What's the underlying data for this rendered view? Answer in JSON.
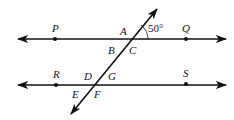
{
  "diagram": {
    "type": "parallel lines cut by a transversal",
    "colors": {
      "line": "#111111",
      "background": "#ffffff"
    },
    "lines": {
      "upper": {
        "name": "line PQ",
        "y": 39
      },
      "lower": {
        "name": "line RS",
        "y": 85
      },
      "transversal": {
        "from": [
          70,
          115
        ],
        "to": [
          157,
          9
        ]
      }
    },
    "points": [
      {
        "label": "P",
        "x": 55,
        "y": 39
      },
      {
        "label": "Q",
        "x": 186,
        "y": 39
      },
      {
        "label": "R",
        "x": 56,
        "y": 85
      },
      {
        "label": "S",
        "x": 186,
        "y": 84
      }
    ],
    "angle_labels": {
      "A": "A",
      "B": "B",
      "C": "C",
      "D": "D",
      "E": "E",
      "F": "F",
      "G": "G"
    },
    "given_angle": "50°"
  }
}
